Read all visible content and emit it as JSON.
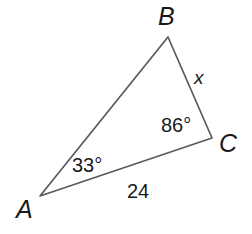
{
  "figure": {
    "type": "triangle-diagram",
    "background_color": "#ffffff",
    "stroke_color": "#5a5a5a",
    "text_color": "#1a1a1a",
    "vertices": {
      "A": {
        "label": "A",
        "x": 40,
        "y": 196
      },
      "B": {
        "label": "B",
        "x": 168,
        "y": 37
      },
      "C": {
        "label": "C",
        "x": 212,
        "y": 138
      }
    },
    "angles": {
      "at_A": "33°",
      "at_C": "86°"
    },
    "sides": {
      "AC": "24",
      "BC": "x"
    }
  }
}
